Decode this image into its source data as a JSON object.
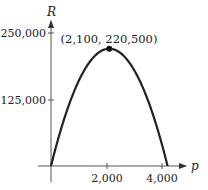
{
  "chart_data": {
    "type": "line",
    "title": "",
    "xlabel": "p",
    "ylabel": "R",
    "function": "R = 210p - 0.05p^2",
    "x_ticks": [
      {
        "value": 2000,
        "label": "2,000"
      },
      {
        "value": 4000,
        "label": "4,000"
      }
    ],
    "y_ticks": [
      {
        "value": 125000,
        "label": "125,000"
      },
      {
        "value": 250000,
        "label": "250,000"
      }
    ],
    "xlim": [
      0,
      4200
    ],
    "ylim": [
      0,
      250000
    ],
    "grid": false,
    "series": [
      {
        "name": "R(p)",
        "x": [
          0,
          500,
          1000,
          1500,
          2100,
          2500,
          3000,
          3500,
          4000,
          4200
        ],
        "y": [
          0,
          92500,
          160000,
          202500,
          220500,
          212500,
          180000,
          122500,
          40000,
          0
        ]
      }
    ],
    "annotations": [
      {
        "x": 2100,
        "y": 220500,
        "label": "(2,100, 220,500)",
        "marker": "filled-circle"
      }
    ]
  },
  "colors": {
    "curve": "#222222",
    "axes": "#555555"
  }
}
